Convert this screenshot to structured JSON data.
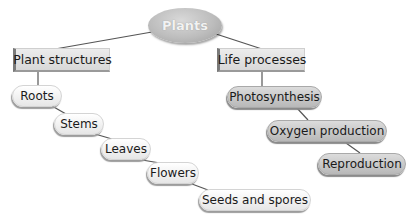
{
  "diagram": {
    "root": {
      "label": "Plants"
    },
    "branches": [
      {
        "label": "Plant structures",
        "children": [
          "Roots",
          "Stems",
          "Leaves",
          "Flowers",
          "Seeds and spores"
        ]
      },
      {
        "label": "Life processes",
        "children": [
          "Photosynthesis",
          "Oxygen production",
          "Reproduction"
        ]
      }
    ]
  },
  "colors": {
    "root_fill": "#bdbdbd",
    "root_text": "#f2f2f2",
    "rect_fill": "#e0e0e0",
    "pill_light_fill": "#f0f0f0",
    "pill_dark_fill": "#c8c8c8",
    "line": "#555555"
  }
}
